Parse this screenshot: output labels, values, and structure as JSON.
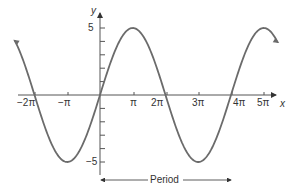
{
  "chart_data": {
    "type": "line",
    "title": "",
    "function": "y = 5 sin(x/2)",
    "xlabel": "x",
    "ylabel": "y",
    "x_tick_labels": [
      "-2π",
      "-π",
      "π",
      "2π",
      "3π",
      "4π",
      "5π"
    ],
    "x_tick_values": [
      -6.2832,
      -3.1416,
      3.1416,
      6.2832,
      9.4248,
      12.5664,
      15.708
    ],
    "y_tick_labels": [
      "5",
      "-5"
    ],
    "y_tick_values": [
      5,
      -5
    ],
    "xlim": [
      -2.6,
      5.9
    ],
    "ylim": [
      -6,
      6.5
    ],
    "xlim_unit": "π",
    "series": [
      {
        "name": "5 sin(x/2)",
        "x": [
          "-2.6π",
          "-2π",
          "-π",
          "0",
          "π",
          "2π",
          "3π",
          "4π",
          "5π",
          "5.4π"
        ],
        "values": [
          3.0,
          0,
          -5,
          0,
          5,
          0,
          -5,
          0,
          5,
          4.0
        ]
      }
    ],
    "annotations": [
      {
        "text": "Period",
        "from": "0",
        "to": "4π",
        "type": "double-arrow"
      }
    ],
    "grid": false,
    "color": "#6b6b6b"
  },
  "labels": {
    "y_axis": "y",
    "x_axis": "x",
    "y_max": "5",
    "y_min": "−5",
    "ticks": [
      "−2π",
      "−π",
      "π",
      "2π",
      "3π",
      "4π",
      "5π"
    ],
    "period": "Period"
  }
}
